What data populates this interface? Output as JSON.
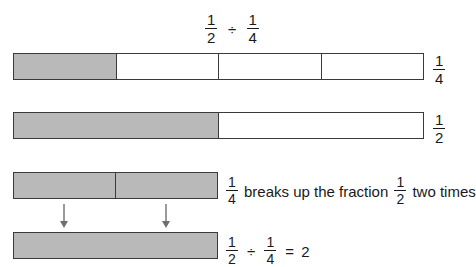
{
  "diagram": {
    "title": {
      "numerator_1": "1",
      "denominator_1": "2",
      "operator": "÷",
      "numerator_2": "1",
      "denominator_2": "4"
    },
    "background_color": "#ffffff",
    "fill_color": "#b9b9b9",
    "stroke_color": "#3a3a3a",
    "text_color": "#1a1a1a",
    "rows": [
      {
        "id": "row-1",
        "segments": 4,
        "filled": [
          true,
          false,
          false,
          false
        ],
        "label": {
          "numerator": "1",
          "denominator": "4"
        },
        "width_fraction": "1"
      },
      {
        "id": "row-2",
        "segments": 2,
        "filled": [
          true,
          false
        ],
        "label": {
          "numerator": "1",
          "denominator": "2"
        },
        "width_fraction": "1"
      },
      {
        "id": "row-3",
        "segments": 2,
        "filled": [
          true,
          true
        ],
        "width_fraction": "1/2"
      },
      {
        "id": "row-4",
        "segments": 1,
        "filled": [
          true
        ],
        "width_fraction": "1/2"
      }
    ],
    "caption_row_3": {
      "frac_a": {
        "numerator": "1",
        "denominator": "4"
      },
      "text_middle": "breaks up the fraction",
      "frac_b": {
        "numerator": "1",
        "denominator": "2"
      },
      "text_end": "two times"
    },
    "caption_row_4": {
      "frac_a": {
        "numerator": "1",
        "denominator": "2"
      },
      "operator": "÷",
      "frac_b": {
        "numerator": "1",
        "denominator": "4"
      },
      "equals": "=",
      "result": "2"
    },
    "arrows": {
      "count": 2,
      "direction": "down",
      "color": "#6f6f6f",
      "positions_x": [
        64,
        166
      ],
      "from_y": 204,
      "to_y": 228
    }
  }
}
